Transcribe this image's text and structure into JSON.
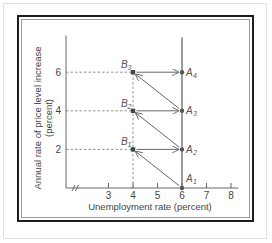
{
  "chart_data": {
    "type": "line",
    "title": "",
    "xlabel": "Unemployment rate (percent)",
    "ylabel": "Annual rate of price level increase",
    "ylabel_line2": "(percent)",
    "xlim": [
      0,
      8.3
    ],
    "x_axis_break": true,
    "ylim": [
      0,
      8
    ],
    "x_ticks": [
      3,
      4,
      5,
      6,
      7,
      8
    ],
    "y_ticks": [
      2,
      4,
      6
    ],
    "grid": false,
    "long_run_vertical_line": {
      "x": 6,
      "y_from": 0,
      "y_to": 7.8
    },
    "points": [
      {
        "name": "B",
        "sub": "1",
        "x": 4,
        "y": 2,
        "kind": "square"
      },
      {
        "name": "B",
        "sub": "2",
        "x": 4,
        "y": 4,
        "kind": "square"
      },
      {
        "name": "B",
        "sub": "3",
        "x": 4,
        "y": 6,
        "kind": "square"
      },
      {
        "name": "A",
        "sub": "1",
        "x": 6,
        "y": 0,
        "kind": "dot"
      },
      {
        "name": "A",
        "sub": "2",
        "x": 6,
        "y": 2,
        "kind": "dot"
      },
      {
        "name": "A",
        "sub": "3",
        "x": 6,
        "y": 4,
        "kind": "dot"
      },
      {
        "name": "A",
        "sub": "4",
        "x": 6,
        "y": 6,
        "kind": "dot"
      }
    ],
    "arrows": [
      {
        "from": [
          6,
          0
        ],
        "to": [
          4,
          2
        ]
      },
      {
        "from": [
          4,
          2
        ],
        "to": [
          6,
          2
        ]
      },
      {
        "from": [
          6,
          2
        ],
        "to": [
          4,
          4
        ]
      },
      {
        "from": [
          4,
          4
        ],
        "to": [
          6,
          4
        ]
      },
      {
        "from": [
          6,
          4
        ],
        "to": [
          4,
          6
        ]
      },
      {
        "from": [
          4,
          6
        ],
        "to": [
          6,
          6
        ]
      }
    ],
    "dashed_guides": [
      {
        "from": [
          0,
          2
        ],
        "to": [
          4,
          2
        ]
      },
      {
        "from": [
          0,
          4
        ],
        "to": [
          4,
          4
        ]
      },
      {
        "from": [
          0,
          6
        ],
        "to": [
          4,
          6
        ]
      },
      {
        "from": [
          4,
          0
        ],
        "to": [
          4,
          6
        ]
      }
    ]
  }
}
